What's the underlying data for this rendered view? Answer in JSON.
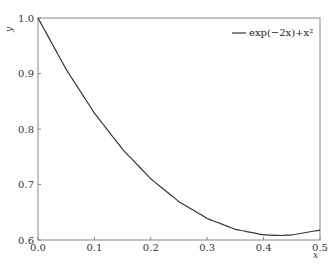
{
  "chart_data": {
    "type": "line",
    "title": "",
    "xlabel": "x",
    "ylabel": "y",
    "xlim": [
      0.0,
      0.5
    ],
    "ylim": [
      0.6,
      1.0
    ],
    "grid": false,
    "legend_position": "upper right",
    "x_ticks": [
      "0.0",
      "0.1",
      "0.2",
      "0.3",
      "0.4",
      "0.5"
    ],
    "y_ticks": [
      "0.6",
      "0.7",
      "0.8",
      "0.9",
      "1.0"
    ],
    "series": [
      {
        "name": "exp(−2x)+x²",
        "color": "#333333",
        "x": [
          0.0,
          0.05,
          0.1,
          0.15,
          0.2,
          0.25,
          0.3,
          0.35,
          0.4,
          0.43,
          0.45,
          0.5
        ],
        "values": [
          1.0,
          0.9073,
          0.8287,
          0.7633,
          0.7103,
          0.669,
          0.6388,
          0.6191,
          0.6093,
          0.6081,
          0.6091,
          0.6179
        ]
      }
    ]
  },
  "legend": {
    "label": "exp(−2x)+x²"
  },
  "axes": {
    "xlabel": "x",
    "ylabel": "y"
  }
}
